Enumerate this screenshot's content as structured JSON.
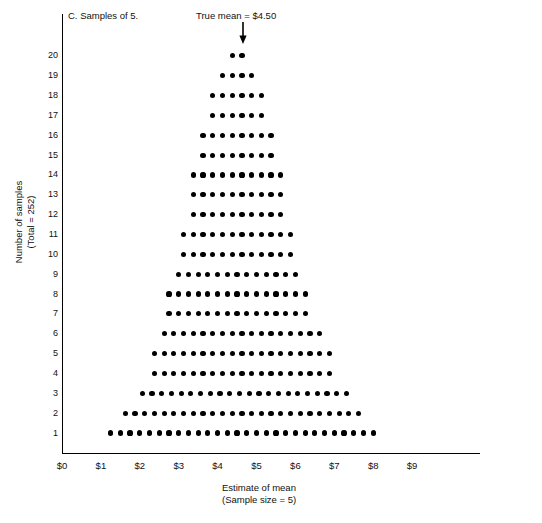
{
  "figure": {
    "panel_title": "C. Samples of 5.",
    "true_mean_annotation": "True mean = $4.50",
    "arrow_icon": "down-arrow-icon"
  },
  "axes": {
    "y_label_line1": "Number of samples",
    "y_label_line2": "(Total = 252)",
    "x_label_line1": "Estimate of mean",
    "x_label_line2": "(Sample size = 5)",
    "x_ticks": [
      "$0",
      "$1",
      "$2",
      "$3",
      "$4",
      "$5",
      "$6",
      "$7",
      "$8",
      "$9"
    ],
    "y_ticks": [
      "20",
      "19",
      "18",
      "17",
      "16",
      "15",
      "14",
      "13",
      "12",
      "11",
      "10",
      "9",
      "8",
      "7",
      "6",
      "5",
      "4",
      "3",
      "2",
      "1"
    ]
  },
  "chart_data": {
    "type": "bar",
    "title": "C. Samples of 5.",
    "subtitle": "True mean = $4.50",
    "xlabel": "Estimate of mean (Sample size = 5)",
    "ylabel": "Number of samples (Total = 252)",
    "xlim": [
      0,
      10.7
    ],
    "ylim": [
      0,
      20.8
    ],
    "grid": false,
    "legend": null,
    "annotations": [
      {
        "text": "True mean = $4.50",
        "x": 4.5,
        "arrow": "down"
      }
    ],
    "dot_spacing_dollars": 0.25,
    "total_dots": 252,
    "rows": [
      {
        "level": 20,
        "count": 2,
        "x_start": 4.375,
        "x_end": 4.625
      },
      {
        "level": 19,
        "count": 4,
        "x_start": 4.125,
        "x_end": 4.875
      },
      {
        "level": 18,
        "count": 6,
        "x_start": 3.875,
        "x_end": 5.125
      },
      {
        "level": 17,
        "count": 6,
        "x_start": 3.875,
        "x_end": 5.125
      },
      {
        "level": 16,
        "count": 8,
        "x_start": 3.625,
        "x_end": 5.375
      },
      {
        "level": 15,
        "count": 8,
        "x_start": 3.625,
        "x_end": 5.375
      },
      {
        "level": 14,
        "count": 10,
        "x_start": 3.375,
        "x_end": 5.625
      },
      {
        "level": 13,
        "count": 10,
        "x_start": 3.375,
        "x_end": 5.625
      },
      {
        "level": 12,
        "count": 10,
        "x_start": 3.375,
        "x_end": 5.625
      },
      {
        "level": 11,
        "count": 12,
        "x_start": 3.125,
        "x_end": 5.875
      },
      {
        "level": 10,
        "count": 12,
        "x_start": 3.125,
        "x_end": 5.875
      },
      {
        "level": 9,
        "count": 13,
        "x_start": 3.0,
        "x_end": 6.0
      },
      {
        "level": 8,
        "count": 15,
        "x_start": 2.75,
        "x_end": 6.25
      },
      {
        "level": 7,
        "count": 15,
        "x_start": 2.75,
        "x_end": 6.25
      },
      {
        "level": 6,
        "count": 17,
        "x_start": 2.625,
        "x_end": 6.625
      },
      {
        "level": 5,
        "count": 19,
        "x_start": 2.5,
        "x_end": 6.75
      },
      {
        "level": 4,
        "count": 19,
        "x_start": 2.5,
        "x_end": 6.75
      },
      {
        "level": 3,
        "count": 22,
        "x_start": 2.375,
        "x_end": 7.0
      },
      {
        "level": 2,
        "count": 25,
        "x_start": 2.125,
        "x_end": 7.125
      },
      {
        "level": 1,
        "count": 28,
        "x_start": 2.0,
        "x_end": 7.25
      }
    ],
    "distribution_by_dollar": {
      "description": "Column heights (number of samples stacked) read bottom-up across the dot pyramid",
      "x_values": [
        2.0,
        2.25,
        2.5,
        2.75,
        3.0,
        3.25,
        3.5,
        3.75,
        4.0,
        4.25,
        4.5,
        4.75,
        5.0,
        5.25,
        5.5,
        5.75,
        6.0,
        6.25,
        6.5,
        6.75,
        7.0,
        7.25
      ],
      "heights": [
        1,
        2,
        5,
        8,
        9,
        11,
        14,
        17,
        19,
        20,
        20,
        19,
        17,
        14,
        11,
        9,
        8,
        5,
        3,
        2,
        2,
        1
      ]
    },
    "colors": {
      "dot": "#000000",
      "axis": "#000000",
      "text": "#111111",
      "background": "#ffffff"
    }
  }
}
